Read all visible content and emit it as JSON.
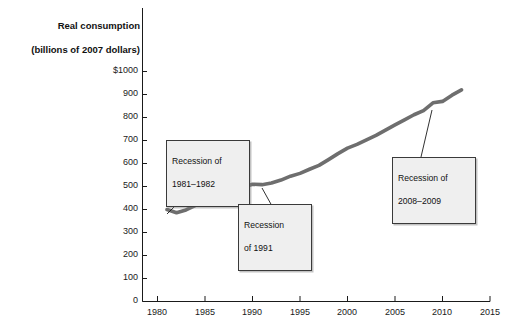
{
  "chart_data": {
    "type": "line",
    "title": "Real consumption\n(billions of 2007 dollars)",
    "title_line1": "Real consumption",
    "title_line2": "(billions of 2007 dollars)",
    "xlabel": "",
    "ylabel": "Real consumption (billions of 2007 dollars)",
    "xlim": [
      1980,
      2015
    ],
    "ylim": [
      0,
      1000
    ],
    "grid": false,
    "legend": "none",
    "line_color": "#6e6e6e",
    "x_ticks": [
      "1980",
      "1985",
      "1990",
      "1995",
      "2000",
      "2005",
      "2010",
      "2015"
    ],
    "x_tick_values": [
      1980,
      1985,
      1990,
      1995,
      2000,
      2005,
      2010,
      2015
    ],
    "y_ticks": [
      "0",
      "100",
      "200",
      "300",
      "400",
      "500",
      "600",
      "700",
      "800",
      "900",
      "$1000"
    ],
    "y_tick_values": [
      0,
      100,
      200,
      300,
      400,
      500,
      600,
      700,
      800,
      900,
      1000
    ],
    "series": [
      {
        "name": "Real consumption",
        "x": [
          1981,
          1982,
          1983,
          1984,
          1985,
          1986,
          1987,
          1988,
          1989,
          1990,
          1991,
          1992,
          1993,
          1994,
          1995,
          1996,
          1997,
          1998,
          1999,
          2000,
          2001,
          2002,
          2003,
          2004,
          2005,
          2006,
          2007,
          2008,
          2009,
          2010,
          2011,
          2012
        ],
        "values": [
          400,
          386,
          398,
          418,
          437,
          455,
          468,
          482,
          497,
          510,
          508,
          515,
          528,
          545,
          557,
          575,
          592,
          617,
          643,
          667,
          683,
          703,
          722,
          745,
          768,
          790,
          812,
          830,
          864,
          870,
          897,
          920
        ]
      }
    ],
    "annotations": [
      {
        "id": "recession-1981-1982",
        "text": "Recession of\n1981–1982",
        "line1": "Recession of",
        "line2": "1981–1982",
        "points_to_year": 1982,
        "points_to_value": 386
      },
      {
        "id": "recession-1991",
        "text": "Recession\nof 1991",
        "line1": "Recession",
        "line2": "of 1991",
        "points_to_year": 1991,
        "points_to_value": 508
      },
      {
        "id": "recession-2008-2009",
        "text": "Recession of\n2008–2009",
        "line1": "Recession of",
        "line2": "2008–2009",
        "points_to_year": 2009,
        "points_to_value": 864
      }
    ]
  }
}
